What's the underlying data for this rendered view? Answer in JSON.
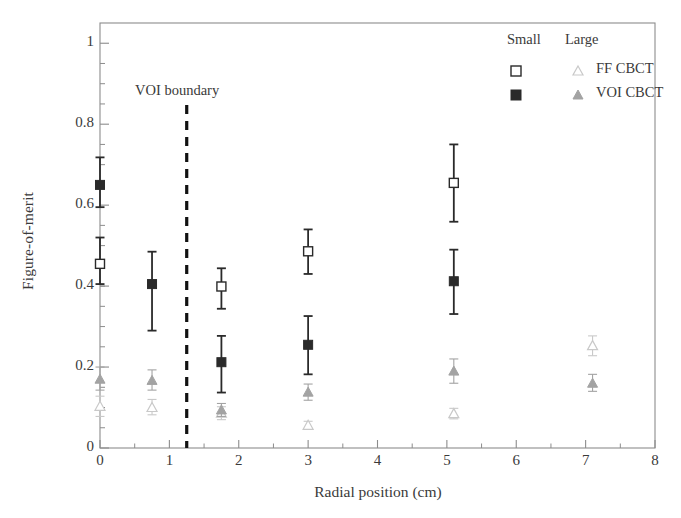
{
  "chart_data": {
    "type": "scatter",
    "title": "",
    "xlabel": "Radial position (cm)",
    "ylabel": "Figure-of-merit",
    "xlim": [
      0,
      8
    ],
    "ylim": [
      0,
      1.05
    ],
    "xticks": [
      "0",
      "1",
      "2",
      "3",
      "4",
      "5",
      "6",
      "7",
      "8"
    ],
    "xtick_values": [
      0,
      1,
      2,
      3,
      4,
      5,
      6,
      7,
      8
    ],
    "yticks": [
      "0",
      "0.2",
      "0.4",
      "0.6",
      "0.8",
      "1"
    ],
    "ytick_values": [
      0,
      0.2,
      0.4,
      0.6,
      0.8,
      1.0
    ],
    "minor_ticks": true,
    "grid": false,
    "legend_position": "top-right",
    "legend_group_headers": [
      "Small",
      "Large"
    ],
    "annotations": [
      {
        "text": "VOI boundary",
        "x": 1.25,
        "y": 0.9,
        "type": "vline-label"
      }
    ],
    "vline": {
      "x": 1.25,
      "style": "dashed",
      "color": "#111111",
      "label": "VOI boundary"
    },
    "series": [
      {
        "name": "FF CBCT",
        "group": "Small",
        "marker": "open-square",
        "color": "#2a2a2a",
        "x": [
          0,
          1.75,
          3.0,
          5.1
        ],
        "y": [
          0.455,
          0.399,
          0.486,
          0.655
        ],
        "yerr_low": [
          0.405,
          0.344,
          0.43,
          0.559
        ],
        "yerr_high": [
          0.52,
          0.444,
          0.54,
          0.75
        ]
      },
      {
        "name": "VOI CBCT",
        "group": "Small",
        "marker": "filled-square",
        "color": "#2a2a2a",
        "x": [
          0,
          0.75,
          1.75,
          3.0,
          5.1
        ],
        "y": [
          0.65,
          0.405,
          0.212,
          0.255,
          0.412
        ],
        "yerr_low": [
          0.595,
          0.29,
          0.137,
          0.182,
          0.331
        ],
        "yerr_high": [
          0.718,
          0.485,
          0.277,
          0.326,
          0.49
        ]
      },
      {
        "name": "FF CBCT",
        "group": "Large",
        "marker": "open-triangle",
        "color": "#c9c9c9",
        "x": [
          0,
          0.75,
          1.75,
          3.0,
          5.1,
          7.1
        ],
        "y": [
          0.103,
          0.1,
          0.086,
          0.056,
          0.085,
          0.253
        ],
        "yerr_low": [
          0.078,
          0.082,
          0.07,
          0.046,
          0.072,
          0.228
        ],
        "yerr_high": [
          0.128,
          0.12,
          0.102,
          0.066,
          0.098,
          0.277
        ]
      },
      {
        "name": "VOI CBCT",
        "group": "Large",
        "marker": "filled-triangle",
        "color": "#a3a3a3",
        "x": [
          0,
          0.75,
          1.75,
          3.0,
          5.1,
          7.1
        ],
        "y": [
          0.17,
          0.167,
          0.094,
          0.138,
          0.19,
          0.16
        ],
        "yerr_low": [
          0.143,
          0.143,
          0.078,
          0.118,
          0.16,
          0.14
        ],
        "yerr_high": [
          0.2,
          0.193,
          0.11,
          0.158,
          0.22,
          0.182
        ]
      }
    ],
    "legend_rows": [
      {
        "label": "FF CBCT",
        "small_marker": "open-square",
        "large_marker": "open-triangle"
      },
      {
        "label": "VOI CBCT",
        "small_marker": "filled-square",
        "large_marker": "filled-triangle"
      }
    ]
  },
  "axis": {
    "x_label": "Radial position (cm)",
    "y_label": "Figure-of-merit"
  },
  "legend": {
    "header_small": "Small",
    "header_large": "Large",
    "row1_label": "FF CBCT",
    "row2_label": "VOI CBCT"
  },
  "annotation": {
    "voi_boundary": "VOI boundary"
  },
  "colors": {
    "frame": "#8c8c8c",
    "dark_marker": "#2a2a2a",
    "mid_gray_marker": "#a3a3a3",
    "light_gray_marker": "#c9c9c9",
    "vline": "#111111",
    "text": "#3a3a3a"
  }
}
